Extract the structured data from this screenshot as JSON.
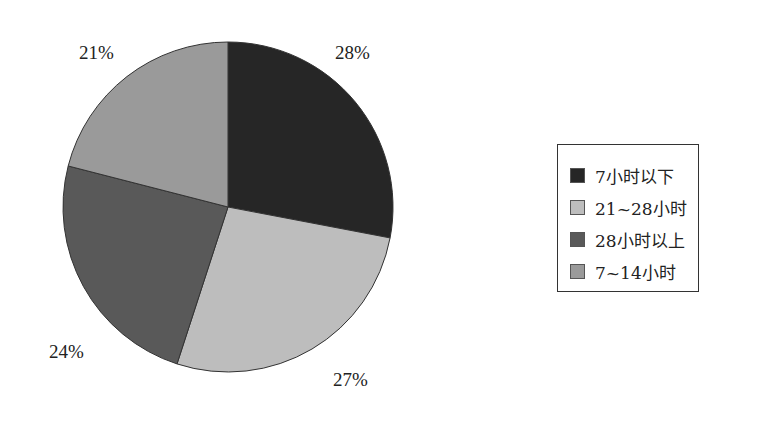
{
  "chart_data": {
    "type": "pie",
    "title": "",
    "categories": [
      "7小时以下",
      "21~28小时",
      "28小时以上",
      "7~14小时"
    ],
    "values": [
      28,
      27,
      24,
      21
    ],
    "unit": "%",
    "labels": [
      "28%",
      "27%",
      "24%",
      "21%"
    ],
    "colors": [
      "#262626",
      "#bdbdbd",
      "#595959",
      "#9a9a9a"
    ],
    "start_angle": "12 o'clock",
    "direction": "clockwise",
    "legend_position": "right"
  },
  "legend": {
    "items": [
      {
        "label": "7小时以下",
        "color": "#262626"
      },
      {
        "label": "21~28小时",
        "color": "#bdbdbd"
      },
      {
        "label": "28小时以上",
        "color": "#595959"
      },
      {
        "label": "7~14小时",
        "color": "#9a9a9a"
      }
    ]
  }
}
